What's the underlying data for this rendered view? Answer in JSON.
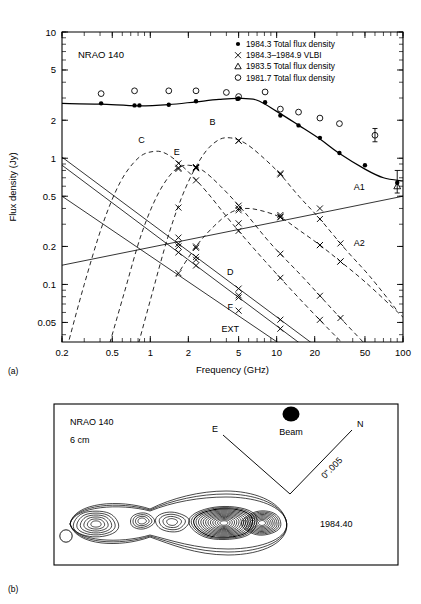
{
  "figure": {
    "panel_a_label": "(a)",
    "panel_b_label": "(b)"
  },
  "panel_a": {
    "source_name": "NRAO 140",
    "legend": [
      {
        "marker": "filled-circle",
        "label": "1984.3 Total flux density"
      },
      {
        "marker": "cross",
        "label": "1984.3–1984.9 VLBI"
      },
      {
        "marker": "triangle",
        "label": "1983.5 Total flux density"
      },
      {
        "marker": "open-circle",
        "label": "1981.7 Total flux density"
      }
    ],
    "component_labels": [
      "C",
      "E",
      "B",
      "A1",
      "A2",
      "D",
      "F",
      "EXT"
    ]
  },
  "panel_b": {
    "source_name": "NRAO 140",
    "wavelength": "6 cm",
    "epoch": "1984.40",
    "beam_label": "Beam",
    "east_label": "E",
    "north_label": "N",
    "scale_label": "0ʺ.005"
  },
  "chart_data": {
    "type": "line",
    "title": "NRAO 140",
    "xlabel": "Frequency (GHz)",
    "ylabel": "Flux density (Jy)",
    "xscale": "log",
    "yscale": "log",
    "xlim": [
      0.2,
      100
    ],
    "ylim": [
      0.035,
      10
    ],
    "xticks": [
      0.2,
      0.5,
      1,
      2,
      5,
      10,
      20,
      50,
      100
    ],
    "xtick_labels": [
      "0.2",
      "0.5",
      "1",
      "2",
      "5",
      "10",
      "20",
      "50",
      "100"
    ],
    "yticks": [
      0.05,
      0.1,
      0.2,
      0.5,
      1,
      2,
      5,
      10
    ],
    "ytick_labels": [
      "0.05",
      "0.1",
      "0.2",
      "0.5",
      "1",
      "2",
      "5",
      "10"
    ],
    "grid": false,
    "legend_position": "top-right",
    "series": [
      {
        "name": "1984.3 Total flux density",
        "marker": "filled-circle",
        "style": "points",
        "points": [
          {
            "x": 0.408,
            "y": 2.72
          },
          {
            "x": 0.75,
            "y": 2.62
          },
          {
            "x": 0.82,
            "y": 2.62
          },
          {
            "x": 1.4,
            "y": 2.65
          },
          {
            "x": 2.3,
            "y": 2.83
          },
          {
            "x": 4.9,
            "y": 2.95
          },
          {
            "x": 5.0,
            "y": 2.97
          },
          {
            "x": 8.1,
            "y": 2.78
          },
          {
            "x": 10.7,
            "y": 2.18
          },
          {
            "x": 14.9,
            "y": 1.82
          },
          {
            "x": 22.0,
            "y": 1.45
          },
          {
            "x": 31.4,
            "y": 1.1
          },
          {
            "x": 50.0,
            "y": 0.88
          },
          {
            "x": 90.0,
            "y": 0.64
          }
        ]
      },
      {
        "name": "1981.7 Total flux density",
        "marker": "open-circle",
        "style": "points",
        "points": [
          {
            "x": 0.408,
            "y": 3.25
          },
          {
            "x": 0.75,
            "y": 3.42
          },
          {
            "x": 1.4,
            "y": 3.42
          },
          {
            "x": 2.3,
            "y": 3.42
          },
          {
            "x": 4.0,
            "y": 3.32
          },
          {
            "x": 5.0,
            "y": 3.08
          },
          {
            "x": 8.1,
            "y": 3.35
          },
          {
            "x": 10.7,
            "y": 2.45
          },
          {
            "x": 14.9,
            "y": 2.32
          },
          {
            "x": 22.0,
            "y": 2.08
          },
          {
            "x": 31.4,
            "y": 1.88
          },
          {
            "x": 60.0,
            "y": 1.52
          }
        ]
      },
      {
        "name": "1983.5 Total flux density",
        "marker": "triangle",
        "style": "points",
        "points": [
          {
            "x": 90.0,
            "y": 0.6
          }
        ]
      },
      {
        "name": "Total spectrum fit",
        "style": "solid-thick",
        "points": [
          {
            "x": 0.2,
            "y": 2.72
          },
          {
            "x": 0.4,
            "y": 2.68
          },
          {
            "x": 0.8,
            "y": 2.6
          },
          {
            "x": 1.4,
            "y": 2.66
          },
          {
            "x": 2.3,
            "y": 2.8
          },
          {
            "x": 3.5,
            "y": 2.92
          },
          {
            "x": 5.0,
            "y": 2.98
          },
          {
            "x": 7.0,
            "y": 2.88
          },
          {
            "x": 10.0,
            "y": 2.35
          },
          {
            "x": 15.0,
            "y": 1.82
          },
          {
            "x": 22.0,
            "y": 1.42
          },
          {
            "x": 31.0,
            "y": 1.1
          },
          {
            "x": 50.0,
            "y": 0.82
          },
          {
            "x": 70.0,
            "y": 0.7
          },
          {
            "x": 100.0,
            "y": 0.66
          }
        ]
      },
      {
        "name": "C",
        "style": "dashed",
        "label_x": 0.85,
        "label_y": 1.32,
        "points": [
          {
            "x": 0.22,
            "y": 0.032
          },
          {
            "x": 0.3,
            "y": 0.1
          },
          {
            "x": 0.42,
            "y": 0.3
          },
          {
            "x": 0.58,
            "y": 0.65
          },
          {
            "x": 0.8,
            "y": 1.0
          },
          {
            "x": 1.05,
            "y": 1.13
          },
          {
            "x": 1.35,
            "y": 1.08
          },
          {
            "x": 1.9,
            "y": 0.82
          },
          {
            "x": 2.8,
            "y": 0.54
          },
          {
            "x": 4.5,
            "y": 0.3
          },
          {
            "x": 8.0,
            "y": 0.155
          },
          {
            "x": 15.0,
            "y": 0.078
          },
          {
            "x": 30.0,
            "y": 0.038
          },
          {
            "x": 45.0,
            "y": 0.026
          }
        ],
        "vlbi_points": []
      },
      {
        "name": "E",
        "style": "dashed",
        "label_x": 1.62,
        "label_y": 1.06,
        "points": [
          {
            "x": 0.46,
            "y": 0.03
          },
          {
            "x": 0.62,
            "y": 0.085
          },
          {
            "x": 0.85,
            "y": 0.25
          },
          {
            "x": 1.15,
            "y": 0.52
          },
          {
            "x": 1.55,
            "y": 0.8
          },
          {
            "x": 2.0,
            "y": 0.88
          },
          {
            "x": 2.6,
            "y": 0.8
          },
          {
            "x": 3.6,
            "y": 0.6
          },
          {
            "x": 5.5,
            "y": 0.38
          },
          {
            "x": 9.0,
            "y": 0.21
          },
          {
            "x": 16.0,
            "y": 0.115
          },
          {
            "x": 30.0,
            "y": 0.058
          },
          {
            "x": 60.0,
            "y": 0.028
          },
          {
            "x": 100.0,
            "y": 0.017
          }
        ],
        "vlbi_points": [
          {
            "x": 1.67,
            "y": 0.84
          },
          {
            "x": 2.3,
            "y": 0.85
          }
        ]
      },
      {
        "name": "B",
        "style": "dashed",
        "label_x": 3.1,
        "label_y": 1.82,
        "points": [
          {
            "x": 0.78,
            "y": 0.03
          },
          {
            "x": 1.0,
            "y": 0.075
          },
          {
            "x": 1.4,
            "y": 0.25
          },
          {
            "x": 1.9,
            "y": 0.58
          },
          {
            "x": 2.6,
            "y": 1.05
          },
          {
            "x": 3.4,
            "y": 1.38
          },
          {
            "x": 4.3,
            "y": 1.45
          },
          {
            "x": 5.6,
            "y": 1.32
          },
          {
            "x": 7.5,
            "y": 1.05
          },
          {
            "x": 10.5,
            "y": 0.76
          },
          {
            "x": 15.0,
            "y": 0.5
          },
          {
            "x": 22.0,
            "y": 0.33
          },
          {
            "x": 35.0,
            "y": 0.19
          },
          {
            "x": 55.0,
            "y": 0.115
          },
          {
            "x": 90.0,
            "y": 0.062
          }
        ],
        "vlbi_points": [
          {
            "x": 2.3,
            "y": 0.85
          },
          {
            "x": 5.0,
            "y": 1.38
          },
          {
            "x": 10.7,
            "y": 0.76
          }
        ]
      },
      {
        "name": "A1",
        "style": "solid-thin",
        "label_x": 45.0,
        "label_y": 0.56,
        "points": [
          {
            "x": 0.2,
            "y": 0.142
          },
          {
            "x": 100.0,
            "y": 0.5
          }
        ],
        "vlbi_points": [
          {
            "x": 1.67,
            "y": 0.235
          },
          {
            "x": 5.0,
            "y": 0.305
          },
          {
            "x": 10.7,
            "y": 0.355
          },
          {
            "x": 22.0,
            "y": 0.4
          }
        ]
      },
      {
        "name": "A2",
        "style": "dashed",
        "label_x": 45.0,
        "label_y": 0.2,
        "points": [
          {
            "x": 1.6,
            "y": 0.115
          },
          {
            "x": 2.3,
            "y": 0.2
          },
          {
            "x": 3.2,
            "y": 0.29
          },
          {
            "x": 4.3,
            "y": 0.37
          },
          {
            "x": 5.6,
            "y": 0.4
          },
          {
            "x": 7.5,
            "y": 0.385
          },
          {
            "x": 10.7,
            "y": 0.34
          },
          {
            "x": 15.0,
            "y": 0.27
          },
          {
            "x": 22.0,
            "y": 0.205
          },
          {
            "x": 32.0,
            "y": 0.152
          },
          {
            "x": 50.0,
            "y": 0.105
          },
          {
            "x": 80.0,
            "y": 0.068
          },
          {
            "x": 100.0,
            "y": 0.055
          }
        ],
        "vlbi_points": [
          {
            "x": 2.3,
            "y": 0.195
          },
          {
            "x": 5.0,
            "y": 0.4
          },
          {
            "x": 10.7,
            "y": 0.345
          },
          {
            "x": 22.0,
            "y": 0.205
          },
          {
            "x": 32.0,
            "y": 0.152
          }
        ]
      },
      {
        "name": "D",
        "style": "solid-thin",
        "label_x": 4.3,
        "label_y": 0.118,
        "points": [
          {
            "x": 0.2,
            "y": 1.02
          },
          {
            "x": 20.0,
            "y": 0.033
          }
        ],
        "vlbi_points": [
          {
            "x": 1.67,
            "y": 0.2
          },
          {
            "x": 2.3,
            "y": 0.157
          },
          {
            "x": 5.0,
            "y": 0.082
          }
        ]
      },
      {
        "name": "F",
        "style": "solid-thin",
        "label_x": 4.3,
        "label_y": 0.063,
        "points": [
          {
            "x": 0.2,
            "y": 0.88
          },
          {
            "x": 16.0,
            "y": 0.033
          }
        ],
        "vlbi_points": [
          {
            "x": 5.0,
            "y": 0.062
          }
        ]
      },
      {
        "name": "EXT",
        "style": "solid-thin",
        "label_x": 4.3,
        "label_y": 0.042,
        "points": [
          {
            "x": 0.2,
            "y": 0.5
          },
          {
            "x": 11.0,
            "y": 0.033
          }
        ],
        "vlbi_points": []
      }
    ],
    "errorbars": [
      {
        "x": 60.0,
        "ylow": 1.35,
        "yhigh": 1.72
      },
      {
        "x": 90.0,
        "ylow": 0.53,
        "yhigh": 0.8
      }
    ]
  }
}
